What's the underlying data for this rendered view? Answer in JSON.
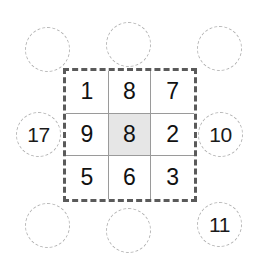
{
  "diagram": {
    "type": "moore-neighborhood-grid",
    "colors": {
      "grid_border": "#5a5a5a",
      "cell_line": "#9a9a9a",
      "highlight_fill": "#e6e6e6",
      "circle_stroke": "#b4b4b4",
      "text": "#111111",
      "background": "#ffffff"
    },
    "grid": {
      "rows": 3,
      "cols": 3,
      "cells": [
        {
          "id": "cell-r1c1",
          "value": "1",
          "highlighted": false
        },
        {
          "id": "cell-r1c2",
          "value": "8",
          "highlighted": false
        },
        {
          "id": "cell-r1c3",
          "value": "7",
          "highlighted": false
        },
        {
          "id": "cell-r2c1",
          "value": "9",
          "highlighted": false
        },
        {
          "id": "cell-r2c2",
          "value": "8",
          "highlighted": true
        },
        {
          "id": "cell-r2c3",
          "value": "2",
          "highlighted": false
        },
        {
          "id": "cell-r3c1",
          "value": "5",
          "highlighted": false
        },
        {
          "id": "cell-r3c2",
          "value": "6",
          "highlighted": false
        },
        {
          "id": "cell-r3c3",
          "value": "3",
          "highlighted": false
        }
      ]
    },
    "neighbors": [
      {
        "id": "neighbor-top-left",
        "position": "top-left",
        "label": ""
      },
      {
        "id": "neighbor-top-center",
        "position": "top-center",
        "label": ""
      },
      {
        "id": "neighbor-top-right",
        "position": "top-right",
        "label": ""
      },
      {
        "id": "neighbor-middle-left",
        "position": "middle-left",
        "label": "17"
      },
      {
        "id": "neighbor-middle-right",
        "position": "middle-right",
        "label": "10"
      },
      {
        "id": "neighbor-bottom-left",
        "position": "bottom-left",
        "label": ""
      },
      {
        "id": "neighbor-bottom-center",
        "position": "bottom-center",
        "label": ""
      },
      {
        "id": "neighbor-bottom-right",
        "position": "bottom-right",
        "label": "11"
      }
    ]
  }
}
